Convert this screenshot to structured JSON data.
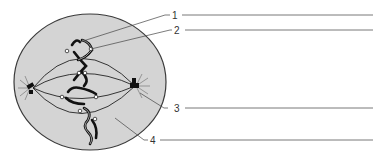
{
  "diagram": {
    "cell": {
      "fill": "#d4d4d4",
      "stroke": "#444444"
    },
    "labels": [
      {
        "id": "1",
        "text": "1",
        "y": 15
      },
      {
        "id": "2",
        "text": "2",
        "y": 30
      },
      {
        "id": "3",
        "text": "3",
        "y": 108
      },
      {
        "id": "4",
        "text": "4",
        "y": 140
      }
    ],
    "answer_lines": [
      "",
      "",
      "",
      ""
    ]
  }
}
